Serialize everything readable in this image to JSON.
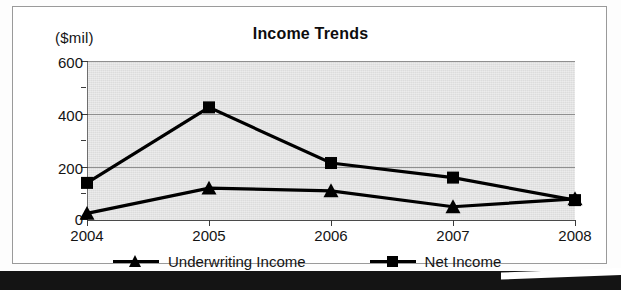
{
  "chart_frame": {
    "title": "Income Trends",
    "y_unit_caption": "($mil)"
  },
  "chart_data": {
    "type": "line",
    "title": "Income Trends",
    "subtitle": "",
    "xlabel": "",
    "ylabel": "($mil)",
    "categories": [
      "2004",
      "2005",
      "2006",
      "2007",
      "2008"
    ],
    "x": [
      2004,
      2005,
      2006,
      2007,
      2008
    ],
    "series": [
      {
        "name": "Underwriting Income",
        "marker": "triangle",
        "color": "#000000",
        "values": [
          25,
          120,
          110,
          50,
          80
        ]
      },
      {
        "name": "Net Income",
        "marker": "square",
        "color": "#000000",
        "values": [
          140,
          425,
          215,
          160,
          75
        ]
      }
    ],
    "ylim": [
      0,
      600
    ],
    "yticks": [
      0,
      200,
      400,
      600
    ],
    "yticks_minor": [
      100,
      300,
      500
    ],
    "ytick_labels": [
      "0",
      "200",
      "400",
      "600"
    ],
    "xtick_labels": [
      "2004",
      "2005",
      "2006",
      "2007",
      "2008"
    ],
    "grid": true,
    "grid_axis": "y",
    "legend": true,
    "legend_position": "bottom",
    "plot_background": "#dcdcdc",
    "figure_background": "#ffffff"
  },
  "axes": {
    "y_ticks": [
      {
        "label": "600",
        "value": 600
      },
      {
        "label": "400",
        "value": 400
      },
      {
        "label": "200",
        "value": 200
      },
      {
        "label": "0",
        "value": 0
      }
    ],
    "x_ticks": [
      {
        "label": "2004"
      },
      {
        "label": "2005"
      },
      {
        "label": "2006"
      },
      {
        "label": "2007"
      },
      {
        "label": "2008"
      }
    ]
  },
  "legend": {
    "items": [
      {
        "label": "Underwriting Income",
        "marker": "triangle"
      },
      {
        "label": "Net Income",
        "marker": "square"
      }
    ]
  }
}
